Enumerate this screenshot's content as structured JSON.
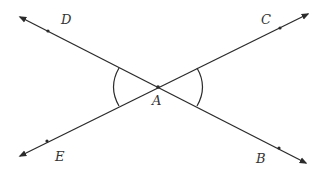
{
  "diagram": {
    "type": "intersecting-lines",
    "line_color": "#2b2b2b",
    "label_color": "#333333",
    "intersection": {
      "label": "A",
      "x": 158,
      "y": 87
    },
    "lines": [
      {
        "name": "DB",
        "from": {
          "x": 20,
          "y": 17
        },
        "to": {
          "x": 306,
          "y": 163
        }
      },
      {
        "name": "EC",
        "from": {
          "x": 20,
          "y": 156
        },
        "to": {
          "x": 308,
          "y": 14
        }
      }
    ],
    "points": [
      {
        "label": "D",
        "dot": {
          "x": 48,
          "y": 31
        },
        "label_pos": {
          "x": 61,
          "y": 24
        }
      },
      {
        "label": "C",
        "dot": {
          "x": 280,
          "y": 28
        },
        "label_pos": {
          "x": 261,
          "y": 24
        }
      },
      {
        "label": "E",
        "dot": {
          "x": 47,
          "y": 141
        },
        "label_pos": {
          "x": 55,
          "y": 161
        }
      },
      {
        "label": "B",
        "dot": {
          "x": 279,
          "y": 148
        },
        "label_pos": {
          "x": 256,
          "y": 163
        }
      },
      {
        "label": "A",
        "dot": {
          "x": 158,
          "y": 87
        },
        "label_pos": {
          "x": 152,
          "y": 105
        }
      }
    ],
    "angle_marks": [
      {
        "name": "angle-DAE",
        "side": "left"
      },
      {
        "name": "angle-CAB",
        "side": "right"
      }
    ]
  }
}
